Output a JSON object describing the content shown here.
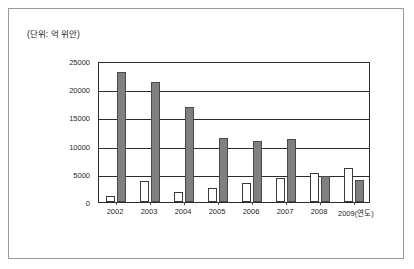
{
  "figure": {
    "unit_label": "(단위: 억 위안)"
  },
  "chart_data": {
    "type": "bar",
    "title": "",
    "subtitle": "",
    "xlabel": "(연도)",
    "ylabel": "",
    "unit_note": "(단위: 억 위안)",
    "categories": [
      "2002",
      "2003",
      "2004",
      "2005",
      "2006",
      "2007",
      "2008",
      "2009"
    ],
    "x_tick_labels": [
      "2002",
      "2003",
      "2004",
      "2005",
      "2006",
      "2007",
      "2008",
      "2009(연도)"
    ],
    "ylim": [
      0,
      25000
    ],
    "y_ticks": [
      0,
      5000,
      10000,
      15000,
      20000,
      25000
    ],
    "y_tick_labels": [
      "0",
      "5000",
      "10000",
      "15000",
      "20000",
      "25000"
    ],
    "grid": true,
    "legend": "none",
    "series": [
      {
        "name": "series-white",
        "color": "#ffffff",
        "values": [
          1000,
          3700,
          1750,
          2450,
          3400,
          4200,
          5200,
          6000
        ]
      },
      {
        "name": "series-gray",
        "color": "#808080",
        "values": [
          23100,
          21300,
          16800,
          11300,
          10900,
          11100,
          4600,
          3900
        ]
      }
    ]
  },
  "colors": {
    "series_white": "#ffffff",
    "series_gray": "#808080",
    "axis": "#2b2b2b",
    "frame": "#9a9a9a",
    "text": "#262626"
  }
}
